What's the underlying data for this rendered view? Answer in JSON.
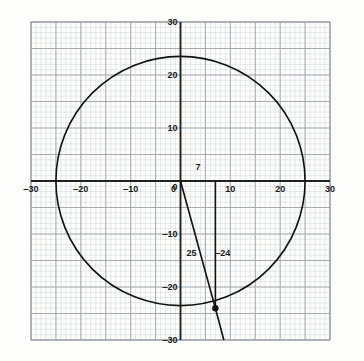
{
  "chart_data": {
    "type": "scatter",
    "title": "",
    "subtitle": "",
    "xlabel": "",
    "ylabel": "",
    "xlim": [
      -30,
      30
    ],
    "ylim": [
      -30,
      30
    ],
    "grid": true,
    "grid_minor_step": 1,
    "grid_major_step": 5,
    "legend": "none",
    "xticks": [
      -30,
      -20,
      -10,
      0,
      10,
      20,
      30
    ],
    "xtick_labels": [
      "‒30",
      "‒20",
      "‒10",
      "0",
      "10",
      "20",
      "30"
    ],
    "yticks": [
      30,
      20,
      10,
      0,
      -10,
      -20,
      -30
    ],
    "ytick_labels": [
      "30",
      "20",
      "10",
      "0",
      "‒10",
      "‒20",
      "‒30"
    ],
    "series": [
      {
        "name": "circle",
        "kind": "circle",
        "center": [
          0,
          0
        ],
        "radius": 25,
        "color": "#111111",
        "linewidth": 1.6
      },
      {
        "name": "terminal-ray",
        "kind": "line",
        "points": [
          [
            0,
            0
          ],
          [
            7,
            -24
          ],
          [
            8.7,
            -30
          ]
        ],
        "color": "#111111",
        "linewidth": 1.6
      },
      {
        "name": "vertical-leg",
        "kind": "line",
        "points": [
          [
            7,
            0
          ],
          [
            7,
            -24
          ]
        ],
        "color": "#111111",
        "linewidth": 1.6
      },
      {
        "name": "terminal-point",
        "kind": "point",
        "points": [
          [
            7,
            -24
          ]
        ],
        "color": "#111111",
        "marker_size": 3.2
      }
    ],
    "annotations": [
      {
        "text": "7",
        "x": 3.5,
        "y": 2.6,
        "name": "annotation-adjacent-7"
      },
      {
        "text": "25",
        "x": 2.2,
        "y": -13.5,
        "name": "annotation-hypotenuse-25"
      },
      {
        "text": "‒24",
        "x": 8.5,
        "y": -13.5,
        "name": "annotation-opposite-neg24"
      }
    ]
  },
  "axes": {
    "x_axis_name": "x-axis",
    "y_axis_name": "y-axis"
  },
  "colors": {
    "curve": "#111111",
    "axis": "#222222",
    "grid_minor": "#cfd4d9",
    "grid_major": "#9aa1a8",
    "frame": "#8d949b",
    "text": "#1a1a1a",
    "background": "#fdfdfc"
  }
}
